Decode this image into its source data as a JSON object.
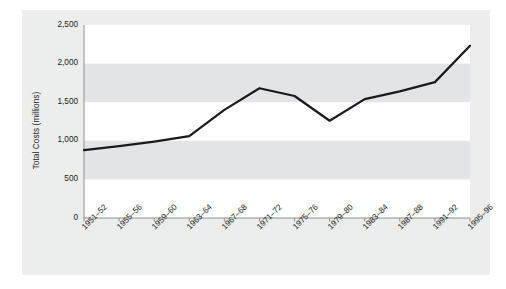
{
  "figure": {
    "background_color": "#eceded",
    "plot_background_color": "#ffffff",
    "band_color": "#e3e4e5",
    "line_color": "#1a1a1a",
    "axis_color": "#8e8f90"
  },
  "chart_data": {
    "type": "line",
    "title": "",
    "xlabel": "",
    "ylabel": "Total Costs (millions)",
    "categories": [
      "1951–52",
      "1955–56",
      "1959–60",
      "1963–64",
      "1967–68",
      "1971–72",
      "1975–76",
      "1979–80",
      "1983–84",
      "1987–88",
      "1991–92",
      "1995–96"
    ],
    "values": [
      880,
      930,
      990,
      1060,
      1400,
      1680,
      1580,
      1260,
      1540,
      1640,
      1760,
      2230
    ],
    "series": [
      {
        "name": "Total Costs",
        "values": [
          880,
          930,
          990,
          1060,
          1400,
          1680,
          1580,
          1260,
          1540,
          1640,
          1760,
          2230
        ]
      }
    ],
    "ylim": [
      0,
      2500
    ],
    "ytick_values": [
      0,
      500,
      1000,
      1500,
      2000,
      2500
    ],
    "ytick_labels": [
      "0",
      "500",
      "1,000",
      "1,500",
      "2,000",
      "2,500"
    ],
    "grid": false,
    "banded_background": true,
    "legend": null,
    "legend_position": "none",
    "line_width_px": 2.2,
    "markers": false
  }
}
